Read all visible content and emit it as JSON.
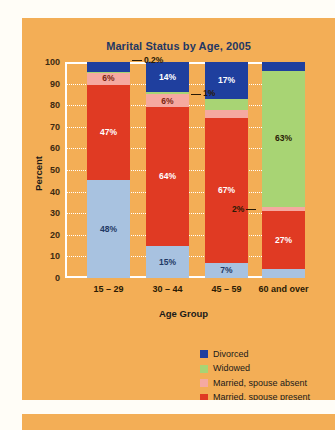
{
  "chart_data": {
    "type": "bar",
    "subtype": "stacked-bar-100",
    "title": "Marital Status by Age, 2005",
    "xlabel": "Age Group",
    "ylabel": "Percent",
    "ylim": [
      0,
      100
    ],
    "yticks": [
      100,
      90,
      80,
      70,
      60,
      50,
      40,
      30,
      20,
      10,
      0
    ],
    "grid": true,
    "legend_position": "bottom-right",
    "categories": [
      "15 – 29",
      "30 – 44",
      "45 – 59",
      "60 and over"
    ],
    "series": [
      {
        "name": "Never married",
        "color": "#a8c2e0",
        "values": [
          48,
          15,
          7,
          4
        ],
        "labels": [
          "48%",
          "15%",
          "7%",
          "4%"
        ],
        "label_color": "#1f3864",
        "callout": [
          false,
          false,
          false,
          false
        ]
      },
      {
        "name": "Married, spouse present",
        "color": "#e03a23",
        "values": [
          47,
          64,
          67,
          27
        ],
        "labels": [
          "47%",
          "64%",
          "67%",
          "27%"
        ],
        "label_color": "#ffffff",
        "callout": [
          false,
          false,
          false,
          false
        ]
      },
      {
        "name": "Married, spouse absent",
        "color": "#f5a9a0",
        "values": [
          6,
          6,
          4,
          2
        ],
        "labels": [
          "6%",
          "6%",
          "4%",
          "2%"
        ],
        "label_color": "#7b2510",
        "callout": [
          false,
          false,
          false,
          true
        ]
      },
      {
        "name": "Widowed",
        "color": "#a8d474",
        "values": [
          0.2,
          1,
          5,
          63
        ],
        "labels": [
          "0.2%",
          "1%",
          "5%",
          "63%"
        ],
        "label_color": "#2a1a05",
        "callout": [
          true,
          true,
          false,
          false
        ]
      },
      {
        "name": "Divorced",
        "color": "#1f3f9e",
        "values": [
          5,
          14,
          17,
          4
        ],
        "labels": [
          "5%",
          "14%",
          "17%",
          "4%"
        ],
        "label_color": "#ffffff",
        "callout": [
          false,
          false,
          false,
          false
        ]
      }
    ],
    "callout_annotations": [
      {
        "text": "0.2%",
        "bar": 0,
        "series": "Widowed"
      },
      {
        "text": "1%",
        "bar": 1,
        "series": "Widowed"
      },
      {
        "text": "2%",
        "bar": 3,
        "series": "Married, spouse absent"
      }
    ]
  },
  "legend": {
    "items": [
      {
        "label": "Divorced",
        "color": "#1f3f9e"
      },
      {
        "label": "Widowed",
        "color": "#a8d474"
      },
      {
        "label": "Married, spouse absent",
        "color": "#f5a9a0"
      },
      {
        "label": "Married, spouse present",
        "color": "#e03a23"
      },
      {
        "label": "Never married",
        "color": "#a8c2e0"
      }
    ]
  },
  "theme": {
    "panel_background": "#f3ae56",
    "page_background": "#fffdf7",
    "title_color": "#1f3864",
    "axis_text_color": "#2a1a05",
    "grid_color": "#ffffff"
  }
}
